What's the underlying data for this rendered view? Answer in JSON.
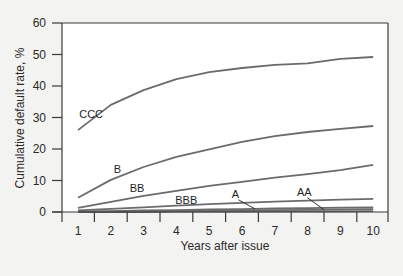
{
  "chart_data": {
    "type": "line",
    "title": "",
    "xlabel": "Years after issue",
    "ylabel": "Cumulative default rate, %",
    "x": [
      1,
      2,
      3,
      4,
      5,
      6,
      7,
      8,
      9,
      10
    ],
    "xlim": [
      1,
      10
    ],
    "ylim": [
      0,
      60
    ],
    "x_ticks": [
      "1",
      "2",
      "3",
      "4",
      "5",
      "6",
      "7",
      "8",
      "9",
      "10"
    ],
    "y_ticks": [
      "0",
      "10",
      "20",
      "30",
      "40",
      "50",
      "60"
    ],
    "grid": false,
    "legend": "inline labels",
    "series": [
      {
        "name": "CCC",
        "values": [
          26.0,
          34.0,
          38.7,
          42.2,
          44.4,
          45.7,
          46.7,
          47.2,
          48.6,
          49.2
        ]
      },
      {
        "name": "B",
        "values": [
          4.5,
          10.2,
          14.3,
          17.5,
          19.9,
          22.3,
          24.1,
          25.4,
          26.4,
          27.3
        ]
      },
      {
        "name": "BB",
        "values": [
          1.3,
          3.2,
          5.1,
          6.7,
          8.3,
          9.6,
          10.9,
          12.0,
          13.3,
          15.0
        ]
      },
      {
        "name": "BBB",
        "values": [
          0.5,
          1.0,
          1.5,
          2.0,
          2.5,
          2.9,
          3.3,
          3.6,
          3.9,
          4.2
        ]
      },
      {
        "name": "A",
        "values": [
          0.2,
          0.3,
          0.5,
          0.6,
          0.8,
          0.9,
          1.1,
          1.2,
          1.4,
          1.5
        ]
      },
      {
        "name": "AA",
        "values": [
          0.0,
          0.1,
          0.2,
          0.3,
          0.4,
          0.5,
          0.6,
          0.7,
          0.8,
          0.9
        ]
      },
      {
        "name": "AAA",
        "values": [
          0.0,
          0.0,
          0.0,
          0.1,
          0.1,
          0.1,
          0.2,
          0.2,
          0.2,
          0.3
        ]
      }
    ],
    "annotations": [
      {
        "text": "CCC",
        "near_x": 1.4,
        "near_y": 30
      },
      {
        "text": "B",
        "near_x": 2.2,
        "near_y": 12.5
      },
      {
        "text": "BB",
        "near_x": 2.8,
        "near_y": 6.5
      },
      {
        "text": "BBB",
        "near_x": 4.3,
        "near_y": 2.5
      },
      {
        "text": "A",
        "near_x": 5.8,
        "near_y": 4.5,
        "pointer_to": "A"
      },
      {
        "text": "AA",
        "near_x": 7.9,
        "near_y": 5.2,
        "pointer_to": "AA"
      }
    ]
  },
  "colors": {
    "background": "#f3f3f1",
    "plot_background": "#ffffff",
    "axis": "#3a3a3a",
    "line": "#6b6b6b",
    "text": "#2a2a2a"
  }
}
